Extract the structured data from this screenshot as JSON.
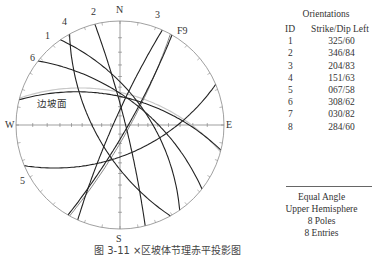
{
  "stereonet": {
    "center": [
      120,
      125
    ],
    "radius": 104,
    "directions": {
      "north": "N",
      "south": "S",
      "east": "E",
      "west": "W"
    },
    "slope_face_label": "边坡面",
    "fault_label": "F9",
    "colors": {
      "primitive": "#888888",
      "axis": "#777777",
      "plane": "#222222",
      "fault": "#666666",
      "slope_face": "#c8c8c8"
    },
    "planes": [
      {
        "id": "1",
        "strike": 325,
        "dip": 60,
        "label_pos": [
          45,
          31
        ]
      },
      {
        "id": "2",
        "strike": 346,
        "dip": 84,
        "label_pos": [
          91,
          7
        ]
      },
      {
        "id": "3",
        "strike": 204,
        "dip": 83,
        "label_pos": [
          155,
          10
        ]
      },
      {
        "id": "4",
        "strike": 151,
        "dip": 63,
        "label_pos": [
          62,
          17
        ]
      },
      {
        "id": "5",
        "strike": 67,
        "dip": 58,
        "label_pos": [
          20,
          176
        ]
      },
      {
        "id": "6",
        "strike": 308,
        "dip": 62,
        "label_pos": [
          30,
          53
        ]
      },
      {
        "id": "7",
        "strike": 30,
        "dip": 82,
        "label_pos": null
      },
      {
        "id": "8",
        "strike": 284,
        "dip": 60,
        "label_pos": null
      }
    ],
    "fault": {
      "strike": 29,
      "dip": 80
    },
    "slope_face": {
      "strike": 285,
      "dip": 56
    }
  },
  "orientations": {
    "title": "Orientations",
    "headers": {
      "id": "ID",
      "value": "Strike/Dip Left"
    },
    "rows": [
      {
        "id": "1",
        "value": "325/60"
      },
      {
        "id": "2",
        "value": "346/84"
      },
      {
        "id": "3",
        "value": "204/83"
      },
      {
        "id": "4",
        "value": "151/63"
      },
      {
        "id": "5",
        "value": "067/58"
      },
      {
        "id": "6",
        "value": "308/62"
      },
      {
        "id": "7",
        "value": "030/82"
      },
      {
        "id": "8",
        "value": "284/60"
      }
    ]
  },
  "summary": {
    "projection": "Equal Angle",
    "hemisphere": "Upper Hemisphere",
    "poles": "8 Poles",
    "entries": "8 Entries"
  },
  "caption": "图 3-11   ×区坡体节理赤平投影图"
}
